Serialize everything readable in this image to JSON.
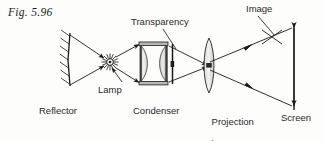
{
  "figure": {
    "caption": "Fig. 5.96",
    "width": 324,
    "height": 141,
    "background_color": "#fdfdfb",
    "ink_color": "#1a1a1a"
  },
  "labels": {
    "transparency": "Transparency",
    "image": "Image",
    "lamp": "Lamp",
    "reflector": "Reflector",
    "condenser": "Condenser",
    "projection_lens_line1": "Projection",
    "projection_lens_line2": "lens",
    "screen": "Screen"
  },
  "components": [
    {
      "name": "reflector",
      "type": "concave-mirror",
      "label": "Reflector",
      "x": 68,
      "y_top": 33,
      "y_bottom": 86,
      "hatching": true,
      "hatch_count": 7
    },
    {
      "name": "lamp",
      "type": "light-source-starburst",
      "label": "Lamp",
      "x": 110,
      "y": 62,
      "radius": 7,
      "ray_count": 16
    },
    {
      "name": "condenser",
      "type": "double-plano-convex-lens",
      "label": "Condenser",
      "element_count": 2,
      "x_left": 140,
      "x_right": 166,
      "y_top": 42,
      "y_bottom": 85
    },
    {
      "name": "transparency",
      "type": "slide-plane",
      "label": "Transparency",
      "x": 172,
      "y_top": 44,
      "y_bottom": 84
    },
    {
      "name": "projection-lens",
      "type": "biconvex-lens",
      "label": "Projection lens",
      "x": 209,
      "y_top": 38,
      "y_bottom": 93
    },
    {
      "name": "screen",
      "type": "vertical-screen",
      "label": "Screen",
      "x": 294,
      "y_top": 24,
      "y_bottom": 110
    },
    {
      "name": "image",
      "type": "inverted-image-arrow",
      "label": "Image",
      "x": 294,
      "y_top": 26,
      "y_bottom": 108
    }
  ],
  "rays": [
    {
      "name": "reflector-to-lamp-upper",
      "from": [
        70,
        36
      ],
      "to": [
        106,
        59
      ]
    },
    {
      "name": "reflector-to-lamp-lower",
      "from": [
        70,
        84
      ],
      "to": [
        106,
        66
      ]
    },
    {
      "name": "lamp-to-condenser-upper",
      "from": [
        114,
        58
      ],
      "to": [
        140,
        44
      ]
    },
    {
      "name": "lamp-to-condenser-lower",
      "from": [
        114,
        67
      ],
      "to": [
        140,
        83
      ]
    },
    {
      "name": "condenser-to-lens-upper",
      "from": [
        168,
        45
      ],
      "to": [
        209,
        66
      ]
    },
    {
      "name": "condenser-to-lens-lower",
      "from": [
        168,
        83
      ],
      "to": [
        209,
        66
      ]
    },
    {
      "name": "lens-to-screen-upper",
      "from": [
        209,
        62
      ],
      "to": [
        293,
        28
      ]
    },
    {
      "name": "lens-to-screen-lower",
      "from": [
        209,
        70
      ],
      "to": [
        293,
        106
      ]
    }
  ],
  "leader_lines": [
    {
      "name": "transparency-leader",
      "from": [
        163,
        30
      ],
      "to": [
        176,
        49
      ]
    },
    {
      "name": "image-leader",
      "from": [
        258,
        17
      ],
      "to": [
        274,
        35
      ]
    },
    {
      "name": "lamp-leader",
      "from": [
        118,
        80
      ],
      "to": [
        110,
        68
      ]
    }
  ]
}
